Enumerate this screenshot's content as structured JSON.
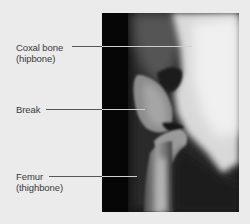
{
  "figure": {
    "type": "labeled x-ray",
    "background_color": "#ebebeb",
    "label_color": "#3a3a3a",
    "labels": [
      {
        "id": "coxal",
        "line1": "Coxal bone",
        "line2": "(hipbone)"
      },
      {
        "id": "break",
        "line1": "Break",
        "line2": ""
      },
      {
        "id": "femur",
        "line1": "Femur",
        "line2": "(thighbone)"
      }
    ]
  }
}
